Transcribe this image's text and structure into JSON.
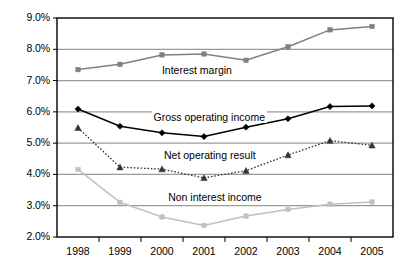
{
  "chart_data": {
    "type": "line",
    "title": "",
    "subtitle": "",
    "xlabel": "",
    "ylabel": "",
    "categories": [
      "1998",
      "1999",
      "2000",
      "2001",
      "2002",
      "2003",
      "2004",
      "2005"
    ],
    "x": [
      1998,
      1999,
      2000,
      2001,
      2002,
      2003,
      2004,
      2005
    ],
    "ylim": [
      2.0,
      9.0
    ],
    "ytick_labels": [
      "2.0%",
      "3.0%",
      "4.0%",
      "5.0%",
      "6.0%",
      "7.0%",
      "8.0%",
      "9.0%"
    ],
    "ytick_values": [
      2.0,
      3.0,
      4.0,
      5.0,
      6.0,
      7.0,
      8.0,
      9.0
    ],
    "yunit": "%",
    "grid": "horizontal",
    "legend_position": "inline-annotations",
    "series": [
      {
        "name": "Interest margin",
        "label": "Interest margin",
        "color": "#808080",
        "marker": "square",
        "line_style": "solid",
        "values": [
          7.35,
          7.52,
          7.82,
          7.85,
          7.65,
          8.08,
          8.62,
          8.73
        ],
        "label_x": 1999.95,
        "label_y": 7.33
      },
      {
        "name": "Gross operating income",
        "label": "Gross operating income",
        "color": "#000000",
        "marker": "diamond",
        "line_style": "solid",
        "values": [
          6.09,
          5.54,
          5.33,
          5.21,
          5.51,
          5.78,
          6.17,
          6.19
        ],
        "label_x": 1999.75,
        "label_y": 5.83
      },
      {
        "name": "Net operating result",
        "label": "Net operating result",
        "color": "#333333",
        "marker": "triangle",
        "line_style": "dotted",
        "values": [
          5.49,
          4.23,
          4.17,
          3.89,
          4.12,
          4.62,
          5.08,
          4.93
        ],
        "label_x": 2000.0,
        "label_y": 4.62
      },
      {
        "name": "Non interest income",
        "label": "Non interest income",
        "color": "#c0c0c0",
        "marker": "square",
        "line_style": "solid",
        "values": [
          4.16,
          3.11,
          2.64,
          2.37,
          2.67,
          2.88,
          3.05,
          3.12
        ],
        "label_x": 2000.1,
        "label_y": 3.27
      }
    ]
  },
  "axes": {
    "plot_border_color": "#000000",
    "gridline_color": "#9a9a9a",
    "background": "#ffffff"
  }
}
